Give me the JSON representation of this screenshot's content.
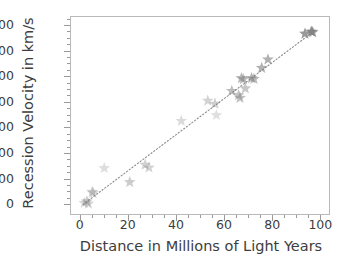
{
  "chart_data": {
    "type": "scatter",
    "title": "",
    "xlabel": "Distance in Millions of Light Years",
    "ylabel": "Recession Velocity in km/s",
    "xlim": [
      -4,
      104
    ],
    "ylim": [
      -420,
      7350
    ],
    "grid": false,
    "legend": null,
    "marker": "star",
    "marker_color": "#7f7f7f",
    "xticks": [
      0,
      20,
      40,
      60,
      80,
      100
    ],
    "xtick_labels": [
      "0",
      "20",
      "40",
      "60",
      "80",
      "100"
    ],
    "yticks": [
      0,
      1000,
      2000,
      3000,
      4000,
      5000,
      6000,
      7000
    ],
    "ytick_labels": [
      "0",
      "1,000",
      "2,000",
      "3,000",
      "4,000",
      "5,000",
      "6,000",
      "7,000"
    ],
    "x_minor_interval": 5,
    "y_minor_interval": 250,
    "trendline": {
      "type": "linear",
      "style": "dotted",
      "color": "#8a8a8a",
      "x_start": 1,
      "y_start": 30,
      "x_end": 97,
      "y_end": 6800,
      "slope": 70.5,
      "intercept": -40
    },
    "points": [
      {
        "x": 1.5,
        "y": 90,
        "alpha": 0.3
      },
      {
        "x": 2.6,
        "y": 150,
        "alpha": 0.42
      },
      {
        "x": 3.2,
        "y": 60,
        "alpha": 0.34
      },
      {
        "x": 4.8,
        "y": 520,
        "alpha": 0.38
      },
      {
        "x": 5.2,
        "y": 470,
        "alpha": 0.3
      },
      {
        "x": 9.8,
        "y": 1450,
        "alpha": 0.26
      },
      {
        "x": 20.4,
        "y": 900,
        "alpha": 0.4
      },
      {
        "x": 26.8,
        "y": 1580,
        "alpha": 0.36
      },
      {
        "x": 28.4,
        "y": 1470,
        "alpha": 0.34
      },
      {
        "x": 41.8,
        "y": 3290,
        "alpha": 0.28
      },
      {
        "x": 52.8,
        "y": 4080,
        "alpha": 0.34
      },
      {
        "x": 55.8,
        "y": 3960,
        "alpha": 0.38
      },
      {
        "x": 56.4,
        "y": 3520,
        "alpha": 0.24
      },
      {
        "x": 62.8,
        "y": 4460,
        "alpha": 0.52
      },
      {
        "x": 65.6,
        "y": 4300,
        "alpha": 0.46
      },
      {
        "x": 66.2,
        "y": 4190,
        "alpha": 0.5
      },
      {
        "x": 66.8,
        "y": 4960,
        "alpha": 0.56
      },
      {
        "x": 67.6,
        "y": 4920,
        "alpha": 0.52
      },
      {
        "x": 68.4,
        "y": 4560,
        "alpha": 0.44
      },
      {
        "x": 71.0,
        "y": 4960,
        "alpha": 0.58
      },
      {
        "x": 72.0,
        "y": 4930,
        "alpha": 0.54
      },
      {
        "x": 75.2,
        "y": 5360,
        "alpha": 0.6
      },
      {
        "x": 77.8,
        "y": 5690,
        "alpha": 0.62
      },
      {
        "x": 93.2,
        "y": 6700,
        "alpha": 0.8
      },
      {
        "x": 95.8,
        "y": 6780,
        "alpha": 0.84
      },
      {
        "x": 96.4,
        "y": 6760,
        "alpha": 0.78
      }
    ]
  }
}
